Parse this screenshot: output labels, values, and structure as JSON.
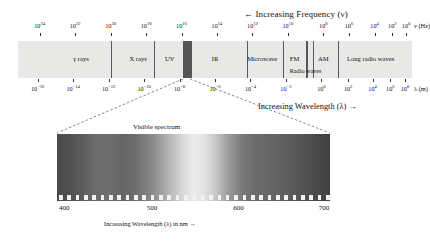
{
  "header": {
    "frequency_direction": "← Increasing Frequency (ν)",
    "wavelength_direction": "Increasing Wavelength (λ) →"
  },
  "frequency_axis": {
    "name": "ν (Hz)",
    "ticks": [
      {
        "label": "10",
        "exp": "24",
        "pos": 0.055
      },
      {
        "label": "10",
        "exp": "22",
        "pos": 0.145
      },
      {
        "label": "10",
        "exp": "20",
        "pos": 0.235
      },
      {
        "label": "10",
        "exp": "18",
        "pos": 0.325
      },
      {
        "label": "10",
        "exp": "16",
        "pos": 0.415
      },
      {
        "label": "10",
        "exp": "14",
        "pos": 0.505
      },
      {
        "label": "10",
        "exp": "12",
        "pos": 0.595
      },
      {
        "label": "10",
        "exp": "10",
        "pos": 0.685
      },
      {
        "label": "10",
        "exp": "8",
        "pos": 0.775
      },
      {
        "label": "10",
        "exp": "6",
        "pos": 0.84
      },
      {
        "label": "10",
        "exp": "4",
        "pos": 0.905
      },
      {
        "label": "10",
        "exp": "2",
        "pos": 0.95
      },
      {
        "label": "10",
        "exp": "0",
        "pos": 0.985
      }
    ]
  },
  "wavelength_axis": {
    "name": "λ (m)",
    "ticks": [
      {
        "label": "10",
        "exp": "−16",
        "pos": 0.05
      },
      {
        "label": "10",
        "exp": "−14",
        "pos": 0.14
      },
      {
        "label": "10",
        "exp": "−12",
        "pos": 0.23
      },
      {
        "label": "10",
        "exp": "−10",
        "pos": 0.32
      },
      {
        "label": "10",
        "exp": "−8",
        "pos": 0.41
      },
      {
        "label": "10",
        "exp": "−6",
        "pos": 0.5
      },
      {
        "label": "10",
        "exp": "−4",
        "pos": 0.59
      },
      {
        "label": "10",
        "exp": "−2",
        "pos": 0.68
      },
      {
        "label": "10",
        "exp": "0",
        "pos": 0.77
      },
      {
        "label": "10",
        "exp": "2",
        "pos": 0.838
      },
      {
        "label": "10",
        "exp": "4",
        "pos": 0.9
      },
      {
        "label": "10",
        "exp": "6",
        "pos": 0.945
      },
      {
        "label": "10",
        "exp": "8",
        "pos": 0.982
      }
    ]
  },
  "spectrum_bar": {
    "background_color": "#e8e8e6",
    "divider_color": "#585858",
    "bands": [
      {
        "name": "gamma-rays",
        "label": "γ rays",
        "center": 0.16
      },
      {
        "name": "x-rays",
        "label": "X rays",
        "center": 0.305
      },
      {
        "name": "ultraviolet",
        "label": "UV",
        "center": 0.385
      },
      {
        "name": "infrared",
        "label": "IR",
        "center": 0.5
      },
      {
        "name": "microwave",
        "label": "Microwave",
        "center": 0.62
      },
      {
        "name": "fm",
        "label": "FM",
        "center": 0.702
      },
      {
        "name": "am",
        "label": "AM",
        "center": 0.775
      },
      {
        "name": "long-radio-waves",
        "label": "Long radio waves",
        "center": 0.895
      }
    ],
    "sub_band": {
      "name": "radio-waves",
      "label": "Radio waves",
      "center": 0.73
    },
    "dividers": [
      0.235,
      0.345,
      0.42,
      0.428,
      0.438,
      0.58,
      0.672,
      0.732,
      0.748,
      0.812
    ],
    "visible_stripe": {
      "start": 0.42,
      "width": 0.018,
      "color": "#555555"
    }
  },
  "visible_spectrum": {
    "title": "Visible spectrum",
    "nm_caption": "Increasing Wavelength (λ) in nm →",
    "nm_ticks": [
      {
        "label": "400",
        "pos": 0.027
      },
      {
        "label": "500",
        "pos": 0.348
      },
      {
        "label": "600",
        "pos": 0.665
      },
      {
        "label": "700",
        "pos": 0.978
      }
    ],
    "tick_count": 33,
    "range_nm": [
      380,
      720
    ]
  },
  "chart_data": {
    "type": "bar",
    "xlabel": "Wavelength (m) / Frequency (Hz)",
    "ylabel": "",
    "categories": [
      "γ rays",
      "X rays",
      "UV",
      "Visible",
      "IR",
      "Microwave",
      "FM",
      "Radio waves",
      "AM",
      "Long radio waves"
    ],
    "values": [
      0.235,
      0.11,
      0.075,
      0.018,
      0.142,
      0.092,
      0.06,
      0.016,
      0.064,
      0.188
    ],
    "frequency_hz_ticks": [
      1e+24,
      1e+22,
      1e+20,
      1e+18,
      1e+16,
      100000000000000.0,
      1000000000000.0,
      10000000000.0,
      100000000.0,
      1000000.0,
      10000.0,
      100.0,
      1.0
    ],
    "wavelength_m_ticks": [
      1e-16,
      1e-14,
      1e-12,
      1e-10,
      1e-08,
      1e-06,
      0.0001,
      0.01,
      1.0,
      100.0,
      10000.0,
      1000000.0,
      100000000.0
    ],
    "visible_nm_ticks": [
      400,
      500,
      600,
      700
    ],
    "grid": false,
    "legend": "none"
  }
}
